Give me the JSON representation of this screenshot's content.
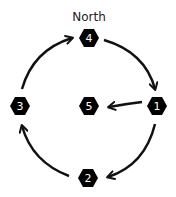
{
  "diagram": {
    "title_label": "North",
    "colors": {
      "node_fill": "#000000",
      "node_text": "#ffffff",
      "edge": "#111111",
      "background": "#ffffff"
    },
    "nodes": [
      {
        "id": "1",
        "label": "1",
        "x": 157,
        "y": 106
      },
      {
        "id": "2",
        "label": "2",
        "x": 88,
        "y": 178
      },
      {
        "id": "3",
        "label": "3",
        "x": 20,
        "y": 106
      },
      {
        "id": "4",
        "label": "4",
        "x": 89,
        "y": 38
      },
      {
        "id": "5",
        "label": "5",
        "x": 89,
        "y": 106
      }
    ],
    "edges": [
      {
        "from": "4",
        "to": "1"
      },
      {
        "from": "1",
        "to": "5"
      },
      {
        "from": "1",
        "to": "2"
      },
      {
        "from": "2",
        "to": "3"
      },
      {
        "from": "3",
        "to": "4"
      }
    ]
  }
}
